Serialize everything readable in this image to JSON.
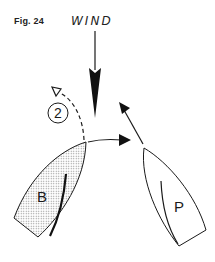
{
  "figure": {
    "label": "Fig. 24",
    "wind_label": "WIND",
    "position_marker": "2",
    "boats": [
      {
        "id": "B",
        "label": "B",
        "fill": "stippled"
      },
      {
        "id": "P",
        "label": "P",
        "fill": "white"
      }
    ]
  },
  "colors": {
    "ink": "#1a1a1a",
    "stipple": "#9a9a9a",
    "background": "#ffffff"
  }
}
